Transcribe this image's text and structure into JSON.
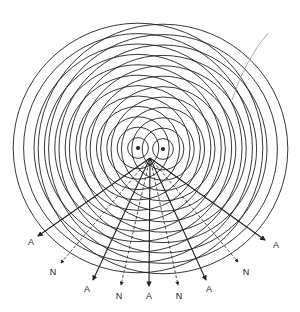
{
  "figure": {
    "sources": [
      {
        "name": "left-source",
        "x": 138,
        "y": 148
      },
      {
        "name": "right-source",
        "x": 163,
        "y": 149
      }
    ],
    "ring_spacing": 10.4,
    "ring_count": 12,
    "colors": {
      "line": "#222222",
      "background": "#ffffff",
      "stray": "#999999"
    },
    "lines": [
      {
        "type": "A",
        "label": "A",
        "end": [
          38,
          236
        ],
        "label_pos": [
          31,
          245
        ],
        "dashed": false
      },
      {
        "type": "N",
        "label": "N",
        "end": [
          61,
          263
        ],
        "label_pos": [
          53,
          275
        ],
        "dashed": true
      },
      {
        "type": "A",
        "label": "A",
        "end": [
          93,
          280
        ],
        "label_pos": [
          87,
          292
        ],
        "dashed": false
      },
      {
        "type": "N",
        "label": "N",
        "end": [
          121,
          285
        ],
        "label_pos": [
          119,
          299
        ],
        "dashed": true
      },
      {
        "type": "A",
        "label": "A",
        "end": [
          149,
          286
        ],
        "label_pos": [
          149,
          299
        ],
        "dashed": false
      },
      {
        "type": "N",
        "label": "N",
        "end": [
          178,
          285
        ],
        "label_pos": [
          179,
          299
        ],
        "dashed": true
      },
      {
        "type": "A",
        "label": "A",
        "end": [
          206,
          280
        ],
        "label_pos": [
          209,
          292
        ],
        "dashed": false
      },
      {
        "type": "N",
        "label": "N",
        "end": [
          238,
          262
        ],
        "label_pos": [
          246,
          275
        ],
        "dashed": true
      },
      {
        "type": "A",
        "label": "A",
        "end": [
          265,
          240
        ],
        "label_pos": [
          276,
          248
        ],
        "dashed": false
      }
    ],
    "origin": [
      150,
      158
    ]
  }
}
